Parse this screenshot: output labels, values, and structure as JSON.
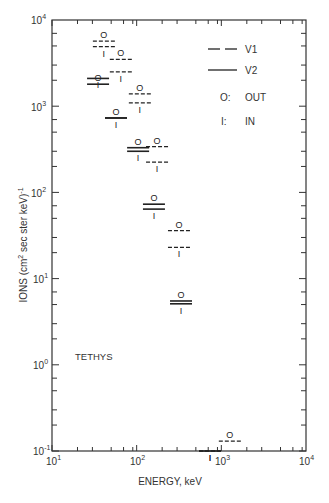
{
  "chart_data": {
    "type": "scatter",
    "title": "",
    "annotation": "TETHYS",
    "xlabel": "ENERGY, keV",
    "ylabel": "IONS (cm² sec ster keV)⁻¹",
    "xscale": "log",
    "yscale": "log",
    "xlim": [
      10,
      10000
    ],
    "ylim": [
      0.1,
      10000
    ],
    "x_ticks": [
      "10^1",
      "10^2",
      "10^3",
      "10^4"
    ],
    "y_ticks": [
      "10^-1",
      "10^0",
      "10^1",
      "10^2",
      "10^3",
      "10^4"
    ],
    "grid": false,
    "legend_position": "upper right",
    "legend": [
      {
        "style": "dashed",
        "label": "V1"
      },
      {
        "style": "solid",
        "label": "V2"
      },
      {
        "marker": "O:",
        "label": "OUT"
      },
      {
        "marker": "I:",
        "label": "IN"
      }
    ],
    "series": [
      {
        "name": "V1 OUT",
        "line": "dashed",
        "marker": "O",
        "points": [
          [
            41,
            5700
          ],
          [
            65,
            3500
          ],
          [
            109,
            1390
          ],
          [
            174,
            340
          ],
          [
            316,
            36
          ],
          [
            1260,
            0.13
          ]
        ]
      },
      {
        "name": "V1 IN",
        "line": "dashed",
        "marker": "I",
        "points": [
          [
            41,
            4900
          ],
          [
            65,
            2500
          ],
          [
            109,
            1090
          ],
          [
            174,
            225
          ],
          [
            316,
            23
          ],
          [
            735,
            0.1
          ]
        ]
      },
      {
        "name": "V2 OUT",
        "line": "solid",
        "marker": "O",
        "points": [
          [
            35,
            1800
          ],
          [
            57,
            730
          ],
          [
            104,
            330
          ],
          [
            160,
            73
          ],
          [
            334,
            5.5
          ]
        ]
      },
      {
        "name": "V2 IN",
        "line": "solid",
        "marker": "I",
        "points": [
          [
            35,
            2100
          ],
          [
            57,
            730
          ],
          [
            104,
            300
          ],
          [
            160,
            64
          ],
          [
            334,
            5.1
          ],
          [
            735,
            0.1
          ]
        ]
      }
    ]
  },
  "labels": {
    "x_tick_labels": [
      {
        "base": "10",
        "exp": "1"
      },
      {
        "base": "10",
        "exp": "2"
      },
      {
        "base": "10",
        "exp": "3"
      },
      {
        "base": "10",
        "exp": "4"
      }
    ],
    "y_tick_labels": [
      {
        "base": "10",
        "exp": "4"
      },
      {
        "base": "10",
        "exp": "3"
      },
      {
        "base": "10",
        "exp": "2"
      },
      {
        "base": "10",
        "exp": "1"
      },
      {
        "base": "10",
        "exp": "0"
      },
      {
        "base": "10",
        "exp": "-1"
      }
    ],
    "legend": {
      "v1": "V1",
      "v2": "V2",
      "out_key": "O:",
      "out": "OUT",
      "in_key": "I:",
      "in": "IN"
    },
    "marker_out": "O",
    "marker_in": "I",
    "annotation": "TETHYS",
    "xlabel": "ENERGY, keV",
    "ylabel_main": "IONS (cm",
    "ylabel_sup": "2",
    "ylabel_rest": " sec ster keV)",
    "ylabel_exp": "-1"
  },
  "colors": {
    "ink": "#333333",
    "background": "#ffffff"
  }
}
